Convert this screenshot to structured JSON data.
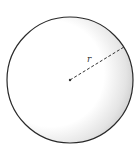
{
  "diagram": {
    "type": "sphere",
    "radius_label": "r",
    "colors": {
      "outline": "#2a2a2a",
      "fill": "#ffffff",
      "shade": "#bdbdbd",
      "dash": "#333333"
    },
    "geometry": {
      "center": [
        70,
        80
      ],
      "radius": 63,
      "radius_end": [
        124,
        47
      ]
    }
  }
}
